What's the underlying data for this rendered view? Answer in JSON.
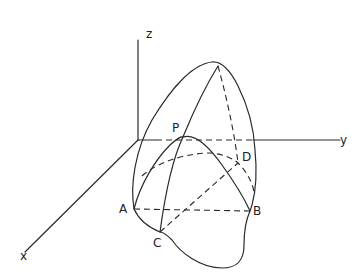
{
  "diagram": {
    "type": "3d-solid-sketch",
    "axes": {
      "x": {
        "label": "x"
      },
      "y": {
        "label": "y"
      },
      "z": {
        "label": "z"
      }
    },
    "points": [
      {
        "id": "P",
        "label": "P"
      },
      {
        "id": "A",
        "label": "A"
      },
      {
        "id": "B",
        "label": "B"
      },
      {
        "id": "C",
        "label": "C"
      },
      {
        "id": "D",
        "label": "D"
      }
    ],
    "stroke_color": "#2a2a2a",
    "background": "#ffffff"
  }
}
